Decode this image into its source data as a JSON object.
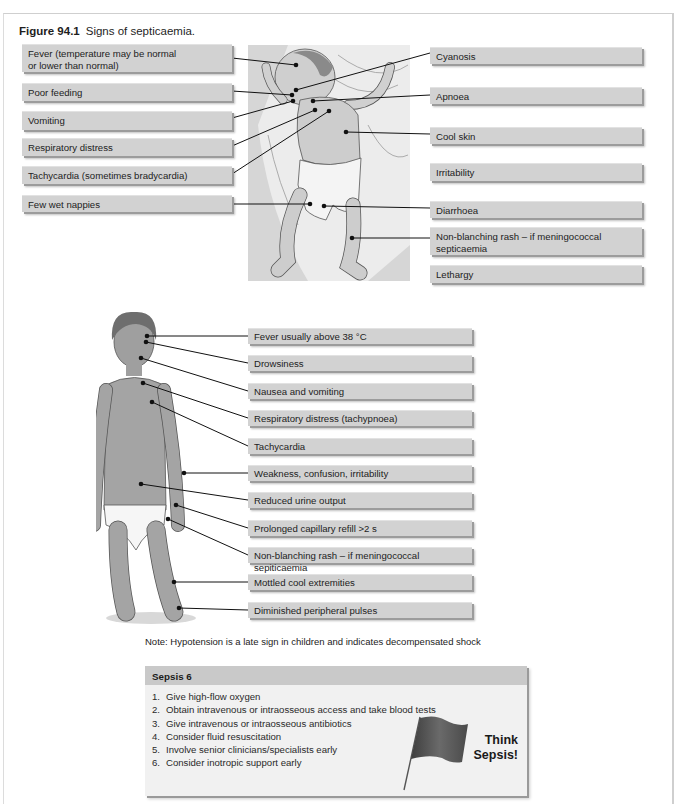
{
  "figure": {
    "number": "Figure 94.1",
    "caption": "Signs of septicaemia."
  },
  "infant": {
    "left_labels": [
      {
        "text": "Fever (temperature may be normal\nor lower than normal)",
        "line1": "Fever (temperature may be normal",
        "line2": "or lower than normal)"
      },
      {
        "text": "Poor feeding"
      },
      {
        "text": "Vomiting"
      },
      {
        "text": "Respiratory distress"
      },
      {
        "text": "Tachycardia (sometimes bradycardia)"
      },
      {
        "text": "Few wet nappies"
      }
    ],
    "right_labels": [
      {
        "text": "Cyanosis"
      },
      {
        "text": "Apnoea"
      },
      {
        "text": "Cool skin"
      },
      {
        "text": "Irritability"
      },
      {
        "text": "Diarrhoea"
      },
      {
        "text": "Non-blanching rash – if meningococcal septicaemia",
        "line1": "Non-blanching rash – if meningococcal",
        "line2": "septicaemia"
      },
      {
        "text": "Lethargy"
      }
    ]
  },
  "child": {
    "labels": [
      {
        "text": "Fever usually above 38 °C"
      },
      {
        "text": "Drowsiness"
      },
      {
        "text": "Nausea and vomiting"
      },
      {
        "text": "Respiratory distress (tachypnoea)"
      },
      {
        "text": "Tachycardia"
      },
      {
        "text": "Weakness, confusion, irritability"
      },
      {
        "text": "Reduced urine output"
      },
      {
        "text": "Prolonged capillary refill >2 s"
      },
      {
        "text": "Non-blanching rash – if meningococcal sepiticaemia"
      },
      {
        "text": "Mottled cool extremities"
      },
      {
        "text": "Diminished peripheral pulses"
      }
    ],
    "note": "Note: Hypotension is a late sign in children and indicates decompensated shock"
  },
  "sepsis6": {
    "title": "Sepsis 6",
    "steps": [
      {
        "num": "1.",
        "text": "Give high-flow oxygen"
      },
      {
        "num": "2.",
        "text": "Obtain intravenous or intraosseous access and take blood tests"
      },
      {
        "num": "3.",
        "text": "Give intravenous or intraosseous antibiotics"
      },
      {
        "num": "4.",
        "text": "Consider fluid resuscitation"
      },
      {
        "num": "5.",
        "text": "Involve senior clinicians/specialists early"
      },
      {
        "num": "6.",
        "text": "Consider inotropic support early"
      }
    ],
    "callout_line1": "Think",
    "callout_line2": "Sepsis!",
    "flag_icon": "red-flag-icon"
  },
  "colors": {
    "label_bg": "#d2d2d2",
    "label_shadow": "#9c9c9c",
    "sepsis_header_bg": "#c9c9c9",
    "sepsis_body_bg": "#f1f1f1",
    "skin": "#a9a9a9",
    "line": "#111111"
  }
}
